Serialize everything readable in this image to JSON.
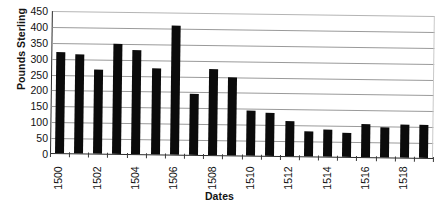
{
  "chart_data": {
    "type": "bar",
    "title": "",
    "xlabel": "Dates",
    "ylabel": "Pounds Sterling",
    "ylim": [
      0,
      450
    ],
    "ytick_step": 50,
    "yticks": [
      450,
      400,
      350,
      300,
      250,
      200,
      150,
      100,
      50,
      0
    ],
    "grid": true,
    "legend": false,
    "bar_color": "#0b0b0b",
    "categories": [
      "1500",
      "1501",
      "1502",
      "1503",
      "1504",
      "1505",
      "1506",
      "1507",
      "1508",
      "1509",
      "1510",
      "1511",
      "1512",
      "1513",
      "1514",
      "1515",
      "1516",
      "1517",
      "1518",
      "1519"
    ],
    "xtick_labels_shown": [
      "1500",
      "1502",
      "1504",
      "1506",
      "1508",
      "1510",
      "1512",
      "1514",
      "1516",
      "1518"
    ],
    "values": [
      318,
      313,
      265,
      345,
      327,
      272,
      405,
      193,
      270,
      247,
      142,
      134,
      110,
      79,
      84,
      75,
      104,
      95,
      103,
      105
    ]
  }
}
